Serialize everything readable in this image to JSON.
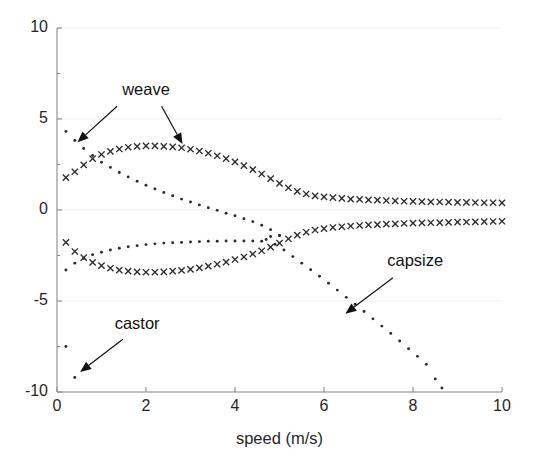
{
  "figure": {
    "width": 534,
    "height": 462,
    "background": "#ffffff",
    "plot_area": {
      "left": 57,
      "top": 28,
      "right": 502,
      "bottom": 392
    }
  },
  "chart_data": {
    "type": "scatter",
    "title": "",
    "xlabel": "speed (m/s)",
    "ylabel": "",
    "xlim": [
      0,
      10
    ],
    "ylim": [
      -10,
      10
    ],
    "xticks": [
      0,
      2,
      4,
      6,
      8,
      10
    ],
    "yticks": [
      -10,
      -5,
      0,
      5,
      10
    ],
    "xtick_labels": [
      "0",
      "2",
      "4",
      "6",
      "8",
      "10"
    ],
    "ytick_labels": [
      "-10",
      "-5",
      "0",
      "5",
      "10"
    ],
    "grid": "horizontal-faint",
    "grid_color": "#efefef",
    "axis_color": "#8a8a8a",
    "marker_color": "#2b2b2b",
    "legend": "none",
    "series": [
      {
        "name": "weave-imaginary-upper",
        "marker": "x",
        "points": [
          [
            0.2,
            1.78
          ],
          [
            0.4,
            2.1
          ],
          [
            0.6,
            2.48
          ],
          [
            0.8,
            2.82
          ],
          [
            1.0,
            3.05
          ],
          [
            1.2,
            3.22
          ],
          [
            1.4,
            3.35
          ],
          [
            1.6,
            3.45
          ],
          [
            1.8,
            3.5
          ],
          [
            2.0,
            3.52
          ],
          [
            2.2,
            3.52
          ],
          [
            2.4,
            3.5
          ],
          [
            2.6,
            3.47
          ],
          [
            2.8,
            3.42
          ],
          [
            3.0,
            3.34
          ],
          [
            3.2,
            3.24
          ],
          [
            3.4,
            3.12
          ],
          [
            3.6,
            2.98
          ],
          [
            3.8,
            2.82
          ],
          [
            4.0,
            2.64
          ],
          [
            4.2,
            2.44
          ],
          [
            4.4,
            2.22
          ],
          [
            4.6,
            1.98
          ],
          [
            4.8,
            1.72
          ],
          [
            5.0,
            1.46
          ],
          [
            5.2,
            1.22
          ],
          [
            5.4,
            1.02
          ],
          [
            5.6,
            0.88
          ],
          [
            5.8,
            0.78
          ],
          [
            6.0,
            0.72
          ],
          [
            6.2,
            0.68
          ],
          [
            6.4,
            0.64
          ],
          [
            6.6,
            0.6
          ],
          [
            6.8,
            0.58
          ],
          [
            7.0,
            0.56
          ],
          [
            7.2,
            0.54
          ],
          [
            7.4,
            0.52
          ],
          [
            7.6,
            0.5
          ],
          [
            7.8,
            0.48
          ],
          [
            8.0,
            0.47
          ],
          [
            8.2,
            0.46
          ],
          [
            8.4,
            0.45
          ],
          [
            8.6,
            0.44
          ],
          [
            8.8,
            0.43
          ],
          [
            9.0,
            0.42
          ],
          [
            9.2,
            0.42
          ],
          [
            9.4,
            0.41
          ],
          [
            9.6,
            0.4
          ],
          [
            9.8,
            0.4
          ],
          [
            10.0,
            0.39
          ]
        ]
      },
      {
        "name": "weave-imaginary-lower",
        "marker": "x",
        "points": [
          [
            0.2,
            -1.78
          ],
          [
            0.4,
            -2.28
          ],
          [
            0.6,
            -2.62
          ],
          [
            0.8,
            -2.88
          ],
          [
            1.0,
            -3.06
          ],
          [
            1.2,
            -3.2
          ],
          [
            1.4,
            -3.3
          ],
          [
            1.6,
            -3.36
          ],
          [
            1.8,
            -3.4
          ],
          [
            2.0,
            -3.42
          ],
          [
            2.2,
            -3.42
          ],
          [
            2.4,
            -3.4
          ],
          [
            2.6,
            -3.36
          ],
          [
            2.8,
            -3.32
          ],
          [
            3.0,
            -3.26
          ],
          [
            3.2,
            -3.18
          ],
          [
            3.4,
            -3.08
          ],
          [
            3.6,
            -2.98
          ],
          [
            3.8,
            -2.86
          ],
          [
            4.0,
            -2.72
          ],
          [
            4.2,
            -2.58
          ],
          [
            4.4,
            -2.42
          ],
          [
            4.6,
            -2.24
          ],
          [
            4.8,
            -2.04
          ],
          [
            5.0,
            -1.82
          ],
          [
            5.2,
            -1.58
          ],
          [
            5.4,
            -1.38
          ],
          [
            5.6,
            -1.22
          ],
          [
            5.8,
            -1.1
          ],
          [
            6.0,
            -1.02
          ],
          [
            6.2,
            -0.96
          ],
          [
            6.4,
            -0.92
          ],
          [
            6.6,
            -0.88
          ],
          [
            6.8,
            -0.85
          ],
          [
            7.0,
            -0.82
          ],
          [
            7.2,
            -0.8
          ],
          [
            7.4,
            -0.78
          ],
          [
            7.6,
            -0.76
          ],
          [
            7.8,
            -0.74
          ],
          [
            8.0,
            -0.72
          ],
          [
            8.2,
            -0.71
          ],
          [
            8.4,
            -0.7
          ],
          [
            8.6,
            -0.69
          ],
          [
            8.8,
            -0.68
          ],
          [
            9.0,
            -0.67
          ],
          [
            9.2,
            -0.66
          ],
          [
            9.4,
            -0.65
          ],
          [
            9.6,
            -0.64
          ],
          [
            9.8,
            -0.63
          ],
          [
            10.0,
            -0.62
          ]
        ]
      },
      {
        "name": "weave-real-descending",
        "marker": "dot",
        "points": [
          [
            0.2,
            4.32
          ],
          [
            0.4,
            3.82
          ],
          [
            0.6,
            3.38
          ],
          [
            0.8,
            3.0
          ],
          [
            1.0,
            2.62
          ],
          [
            1.2,
            2.34
          ],
          [
            1.4,
            2.06
          ],
          [
            1.6,
            1.82
          ],
          [
            1.8,
            1.58
          ],
          [
            2.0,
            1.36
          ],
          [
            2.2,
            1.16
          ],
          [
            2.4,
            0.96
          ],
          [
            2.6,
            0.78
          ],
          [
            2.8,
            0.6
          ],
          [
            3.0,
            0.44
          ],
          [
            3.2,
            0.28
          ],
          [
            3.4,
            0.12
          ],
          [
            3.6,
            -0.02
          ],
          [
            3.8,
            -0.18
          ],
          [
            4.0,
            -0.32
          ],
          [
            4.2,
            -0.48
          ],
          [
            4.4,
            -0.64
          ],
          [
            4.6,
            -0.84
          ],
          [
            4.8,
            -1.08
          ],
          [
            5.0,
            -1.4
          ]
        ]
      },
      {
        "name": "castor-real-ascending",
        "marker": "dot",
        "points": [
          [
            0.2,
            -3.3
          ],
          [
            0.4,
            -2.92
          ],
          [
            0.6,
            -2.66
          ],
          [
            0.8,
            -2.46
          ],
          [
            1.0,
            -2.32
          ],
          [
            1.2,
            -2.2
          ],
          [
            1.4,
            -2.1
          ],
          [
            1.6,
            -2.02
          ],
          [
            1.8,
            -1.96
          ],
          [
            2.0,
            -1.9
          ],
          [
            2.2,
            -1.86
          ],
          [
            2.4,
            -1.82
          ],
          [
            2.6,
            -1.8
          ],
          [
            2.8,
            -1.78
          ],
          [
            3.0,
            -1.76
          ],
          [
            3.2,
            -1.74
          ],
          [
            3.4,
            -1.72
          ],
          [
            3.6,
            -1.72
          ],
          [
            3.8,
            -1.7
          ],
          [
            4.0,
            -1.7
          ],
          [
            4.2,
            -1.7
          ],
          [
            4.4,
            -1.7
          ],
          [
            4.6,
            -1.72
          ],
          [
            4.8,
            -1.46
          ],
          [
            5.0,
            -1.4
          ]
        ]
      },
      {
        "name": "castor-isolated",
        "marker": "dot",
        "points": [
          [
            0.2,
            -7.5
          ],
          [
            0.4,
            -9.2
          ]
        ]
      },
      {
        "name": "capsize-real",
        "marker": "dot",
        "points": [
          [
            4.7,
            -1.62
          ],
          [
            4.9,
            -1.88
          ],
          [
            5.1,
            -2.2
          ],
          [
            5.3,
            -2.56
          ],
          [
            5.5,
            -2.92
          ],
          [
            5.7,
            -3.28
          ],
          [
            5.9,
            -3.64
          ],
          [
            6.1,
            -4.02
          ],
          [
            6.3,
            -4.4
          ],
          [
            6.5,
            -4.8
          ],
          [
            6.7,
            -5.18
          ],
          [
            6.9,
            -5.58
          ],
          [
            7.1,
            -5.98
          ],
          [
            7.3,
            -6.38
          ],
          [
            7.5,
            -6.78
          ],
          [
            7.7,
            -7.2
          ],
          [
            7.9,
            -7.62
          ],
          [
            8.1,
            -8.04
          ],
          [
            8.3,
            -8.48
          ],
          [
            8.5,
            -9.28
          ],
          [
            8.65,
            -9.78
          ]
        ]
      }
    ],
    "annotations": [
      {
        "name": "weave",
        "label": "weave",
        "label_x": 2.0,
        "label_y": 6.3,
        "arrows": [
          {
            "from_x": 1.35,
            "from_y": 5.7,
            "to_x": 0.46,
            "to_y": 3.72
          },
          {
            "from_x": 2.35,
            "from_y": 5.7,
            "to_x": 2.82,
            "to_y": 3.62
          }
        ]
      },
      {
        "name": "capsize",
        "label": "capsize",
        "label_x": 8.05,
        "label_y": -3.05,
        "arrows": [
          {
            "from_x": 7.55,
            "from_y": -3.72,
            "to_x": 6.48,
            "to_y": -5.7
          }
        ]
      },
      {
        "name": "castor",
        "label": "castor",
        "label_x": 1.8,
        "label_y": -6.55,
        "arrows": [
          {
            "from_x": 1.48,
            "from_y": -7.1,
            "to_x": 0.52,
            "to_y": -8.9
          }
        ]
      }
    ]
  }
}
